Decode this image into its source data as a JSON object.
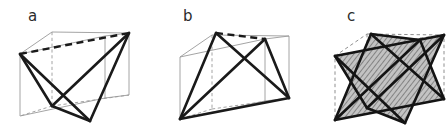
{
  "figure": {
    "type": "geometric-diagram",
    "background_color": "#ffffff",
    "width": 448,
    "height": 132
  },
  "panels": [
    {
      "id": "a",
      "label": "a",
      "caption": "tetrahedron inscribed in cube",
      "cube": {
        "edge_color": "#9a9a9a",
        "hidden_edge_style": "dashed",
        "hidden_edge_color": "#9a9a9a",
        "front_top_left": [
          20,
          54
        ],
        "front_top_right": [
          105,
          36
        ],
        "front_bottom_left": [
          20,
          116
        ],
        "front_bottom_right": [
          105,
          98
        ],
        "back_top_left": [
          52,
          32
        ],
        "back_top_right": [
          129,
          33
        ],
        "back_bottom_left": [
          52,
          106
        ],
        "back_bottom_right": [
          129,
          95
        ]
      },
      "tetrahedron": {
        "edge_color": "#1a1a1a",
        "edge_width": 2.6,
        "hidden_edge_style": "dashed",
        "vertices": [
          {
            "name": "v1",
            "x": 20,
            "y": 54
          },
          {
            "name": "v2",
            "x": 129,
            "y": 33
          },
          {
            "name": "v3",
            "x": 90,
            "y": 121
          },
          {
            "name": "v4",
            "x": 52,
            "y": 106
          }
        ],
        "hidden_edges": [
          [
            "v1",
            "v2"
          ]
        ]
      }
    },
    {
      "id": "b",
      "label": "b",
      "caption": "dual tetrahedron inscribed in cube",
      "cube": {
        "edge_color": "#9a9a9a",
        "hidden_edge_style": "dashed",
        "hidden_edge_color": "#9a9a9a",
        "front_top_left": [
          31,
          57
        ],
        "front_top_right": [
          116,
          39
        ],
        "front_bottom_left": [
          31,
          119
        ],
        "front_bottom_right": [
          116,
          101
        ],
        "back_top_left": [
          63,
          35
        ],
        "back_top_right": [
          140,
          36
        ],
        "back_bottom_left": [
          63,
          109
        ],
        "back_bottom_right": [
          140,
          98
        ]
      },
      "tetrahedron": {
        "edge_color": "#1a1a1a",
        "edge_width": 2.6,
        "hidden_edge_style": "dashed",
        "vertices": [
          {
            "name": "v1",
            "x": 67,
            "y": 33
          },
          {
            "name": "v2",
            "x": 31,
            "y": 119
          },
          {
            "name": "v3",
            "x": 140,
            "y": 98
          },
          {
            "name": "v4",
            "x": 116,
            "y": 39
          }
        ],
        "hidden_edges": [
          [
            "v1",
            "v4"
          ]
        ]
      }
    },
    {
      "id": "c",
      "label": "c",
      "caption": "compound of two tetrahedra (stella octangula)",
      "cube": {
        "edge_color": "#9a9a9a",
        "hidden_edge_style": "dashed",
        "hidden_edge_color": "#9a9a9a",
        "front_top_left": [
          36,
          56
        ],
        "front_top_right": [
          121,
          38
        ],
        "front_bottom_left": [
          36,
          118
        ],
        "front_bottom_right": [
          121,
          100
        ],
        "back_top_left": [
          68,
          34
        ],
        "back_top_right": [
          145,
          35
        ],
        "back_bottom_left": [
          68,
          108
        ],
        "back_bottom_right": [
          145,
          97
        ]
      },
      "compound": {
        "face_fill": "#b8b8b8",
        "face_hatch": "diagonal-lines",
        "hatch_color": "#6a6a6a",
        "edge_color": "#1a1a1a",
        "edge_width": 2.6,
        "tetra1_vertices": [
          {
            "name": "t1a",
            "x": 36,
            "y": 56
          },
          {
            "name": "t1b",
            "x": 145,
            "y": 35
          },
          {
            "name": "t1c",
            "x": 106,
            "y": 123
          },
          {
            "name": "t1d",
            "x": 68,
            "y": 108
          }
        ],
        "tetra2_vertices": [
          {
            "name": "t2a",
            "x": 72,
            "y": 34
          },
          {
            "name": "t2b",
            "x": 36,
            "y": 120
          },
          {
            "name": "t2c",
            "x": 145,
            "y": 99
          },
          {
            "name": "t2d",
            "x": 121,
            "y": 40
          }
        ]
      }
    }
  ]
}
